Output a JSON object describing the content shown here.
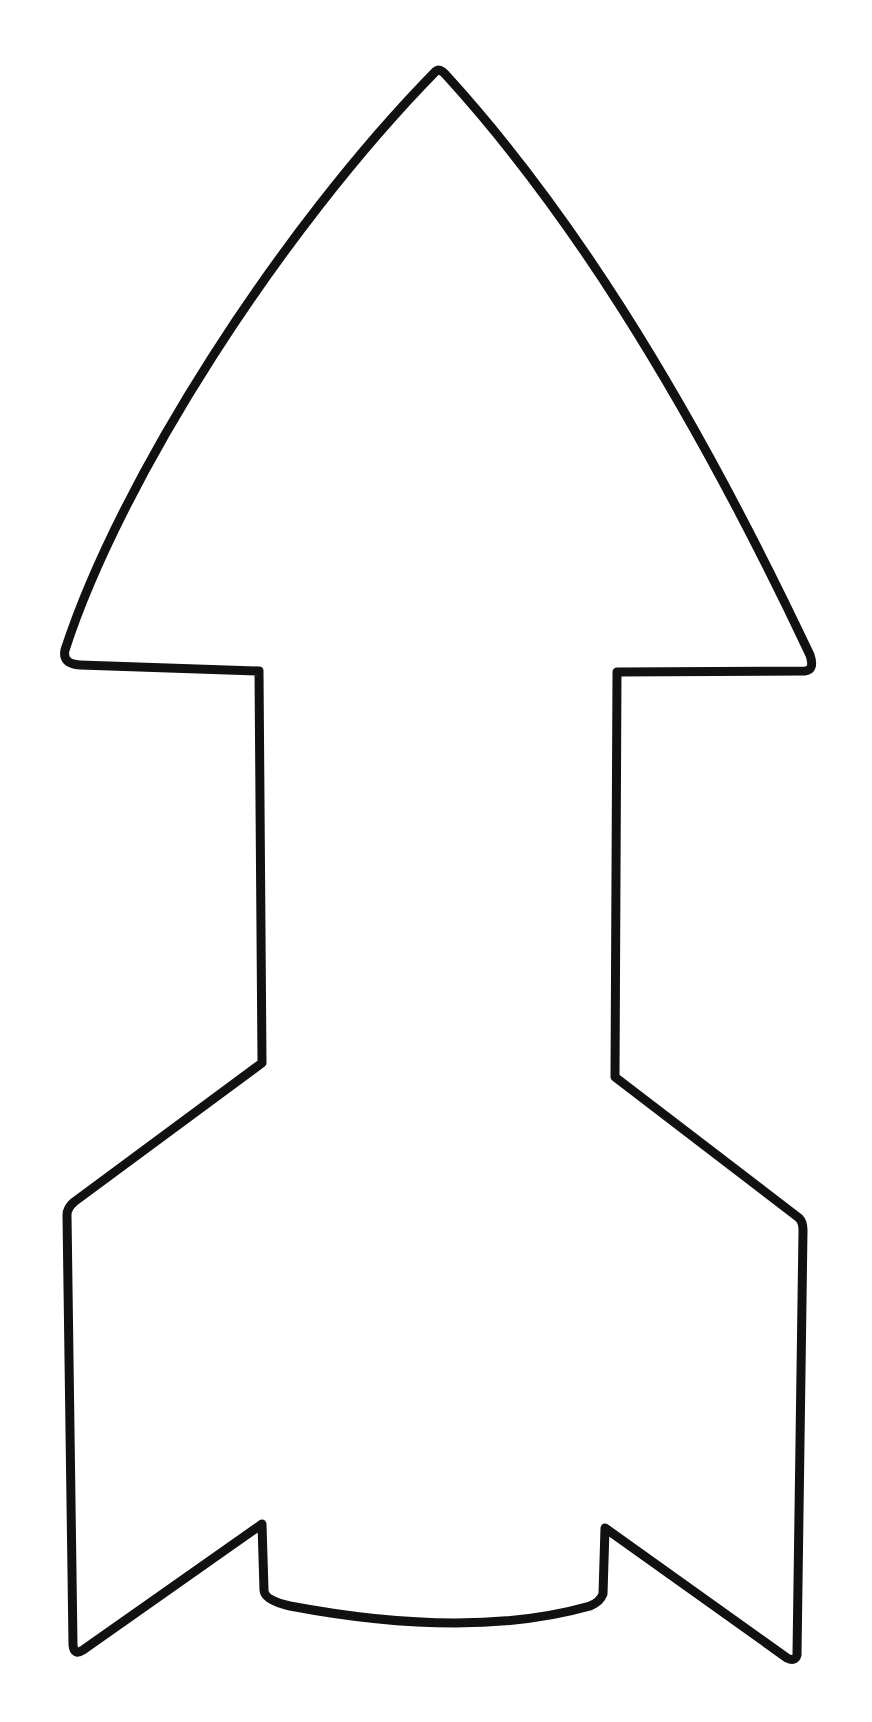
{
  "image": {
    "subject": "rocket outline",
    "description": "Black hand-drawn outline of a rocket shape on white background: pointed curved nose cone, narrow body, and two fins with a notched curved bottom",
    "background_color": "#ffffff",
    "stroke_color": "#111111",
    "parts": [
      {
        "name": "nose-cone",
        "shape": "curved triangular arrowhead"
      },
      {
        "name": "body",
        "shape": "narrow vertical rectangle"
      },
      {
        "name": "left-fin",
        "shape": "angled fin with pointed bottom"
      },
      {
        "name": "right-fin",
        "shape": "angled fin with pointed bottom"
      },
      {
        "name": "nozzle-base",
        "shape": "curved bottom between fins"
      }
    ]
  }
}
